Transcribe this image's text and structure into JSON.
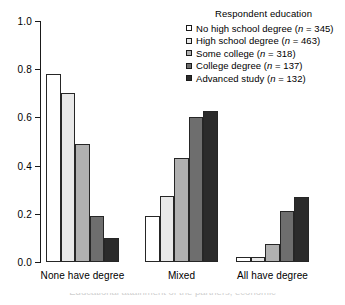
{
  "chart_data": {
    "type": "bar",
    "title": "",
    "xlabel": "",
    "ylabel": "",
    "categories": [
      "None have degree",
      "Mixed",
      "All have degree"
    ],
    "ylim": [
      0.0,
      1.0
    ],
    "ytick_labels": [
      "0.0",
      "0.2",
      "0.4",
      "0.6",
      "0.8",
      "1.0"
    ],
    "ytick_values": [
      0.0,
      0.2,
      0.4,
      0.6,
      0.8,
      1.0
    ],
    "grid": false,
    "legend_position": "top-right",
    "legend_title": "Respondent education",
    "series": [
      {
        "name": "No high school degree",
        "n": 345,
        "label": "No high school degree (n = 345)",
        "color": "#ffffff",
        "values": [
          0.78,
          0.19,
          0.02
        ]
      },
      {
        "name": "High school degree",
        "n": 463,
        "label": "High school degree (n = 463)",
        "color": "#e8e8e8",
        "values": [
          0.7,
          0.275,
          0.02
        ]
      },
      {
        "name": "Some college",
        "n": 318,
        "label": "Some college (n = 318)",
        "color": "#b0b0b0",
        "values": [
          0.49,
          0.43,
          0.075
        ]
      },
      {
        "name": "College degree",
        "n": 137,
        "label": "College degree (n = 137)",
        "color": "#6e6e6e",
        "values": [
          0.19,
          0.6,
          0.21
        ]
      },
      {
        "name": "Advanced study",
        "n": 132,
        "label": "Advanced study (n = 132)",
        "color": "#2b2b2b",
        "values": [
          0.1,
          0.625,
          0.27
        ]
      }
    ]
  },
  "legend": {
    "title": "Respondent education",
    "items": [
      {
        "label_main": "No high school degree (",
        "n_label": "n",
        "label_tail": " = 345)"
      },
      {
        "label_main": "High school degree (",
        "n_label": "n",
        "label_tail": " = 463)"
      },
      {
        "label_main": "Some college (",
        "n_label": "n",
        "label_tail": " = 318)"
      },
      {
        "label_main": "College degree (",
        "n_label": "n",
        "label_tail": " = 137)"
      },
      {
        "label_main": "Advanced study (",
        "n_label": "n",
        "label_tail": " = 132)"
      }
    ]
  },
  "axis": {
    "y_labels": [
      "1.0",
      "0.8",
      "0.6",
      "0.4",
      "0.2",
      "0.0"
    ]
  },
  "x_labels": [
    "None have degree",
    "Mixed",
    "All have degree"
  ],
  "caption": {
    "partial_text": "Educational attainment of the partners, economic"
  },
  "colors": {
    "axis": "#1a1a1a",
    "bar_outline": "#262626",
    "background": "#ffffff"
  }
}
